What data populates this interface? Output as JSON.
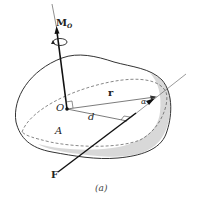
{
  "figure": {
    "caption": "(a)",
    "labels": {
      "moment": "M",
      "moment_sub": "O",
      "origin": "O",
      "position_vector": "r",
      "angle": "α",
      "distance": "d",
      "line_name": "A",
      "force": "F"
    },
    "colors": {
      "stroke": "#333333",
      "shade": "#d6d6d6",
      "background": "#ffffff"
    }
  }
}
